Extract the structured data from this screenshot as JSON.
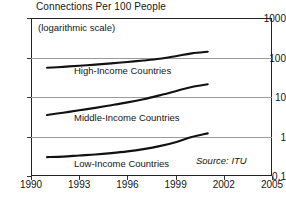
{
  "chart_data": {
    "type": "line",
    "title": "Connections Per 100 People",
    "subtitle": "(logarithmic scale)",
    "xlabel": "",
    "ylabel": "",
    "scale": "log",
    "grid": true,
    "legend_position": "inline",
    "source": "Source: ITU",
    "xlim": [
      1990,
      2005
    ],
    "ylim": [
      0.1,
      1000
    ],
    "xticks": [
      "1990",
      "1993",
      "1996",
      "1999",
      "2002",
      "2005"
    ],
    "xtick_values": [
      1990,
      1993,
      1996,
      1999,
      2002,
      2005
    ],
    "yticks": [
      "1000",
      "100",
      "10",
      "1",
      "0.1"
    ],
    "ytick_values": [
      1000,
      100,
      10,
      1,
      0.1
    ],
    "series": [
      {
        "name": "High-Income Countries",
        "x": [
          1991,
          1992,
          1993,
          1994,
          1995,
          1996,
          1997,
          1998,
          1999,
          2000,
          2001
        ],
        "values": [
          55,
          58,
          62,
          66,
          71,
          77,
          84,
          93,
          108,
          127,
          140
        ]
      },
      {
        "name": "Middle-Income Countries",
        "x": [
          1991,
          1992,
          1993,
          1994,
          1995,
          1996,
          1997,
          1998,
          1999,
          2000,
          2001
        ],
        "values": [
          3.5,
          4.0,
          4.6,
          5.3,
          6.2,
          7.3,
          8.8,
          11.0,
          14.0,
          18.0,
          21.0
        ]
      },
      {
        "name": "Low-Income Countries",
        "x": [
          1991,
          1992,
          1993,
          1994,
          1995,
          1996,
          1997,
          1998,
          1999,
          2000,
          2001
        ],
        "values": [
          0.3,
          0.31,
          0.33,
          0.35,
          0.38,
          0.42,
          0.48,
          0.57,
          0.72,
          0.97,
          1.2
        ]
      }
    ],
    "series_label_positions": [
      {
        "label": "High-Income Countries",
        "left": 74,
        "top": 65
      },
      {
        "label": "Middle-Income Countries",
        "left": 74,
        "top": 112
      },
      {
        "label": "Low-Income Countries",
        "left": 74,
        "top": 158
      }
    ],
    "colors": {
      "curve": "#111111",
      "grid": "#9a9a9a",
      "frame": "#222222",
      "text": "#141414",
      "background": "#ffffff"
    }
  }
}
